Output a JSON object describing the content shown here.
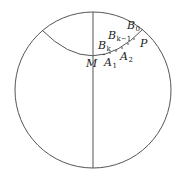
{
  "figure": {
    "colors": {
      "stroke": "#555555",
      "text": "#222222",
      "background": "#ffffff"
    }
  },
  "labels": {
    "B0": {
      "main": "B",
      "sub": "0"
    },
    "Bk1": {
      "main": "B",
      "sub": "k−1"
    },
    "Bk": {
      "main": "B",
      "sub": "k"
    },
    "P": {
      "main": "P",
      "sub": ""
    },
    "M": {
      "main": "M",
      "sub": ""
    },
    "A1": {
      "main": "A",
      "sub": "1"
    },
    "A2": {
      "main": "A",
      "sub": "2"
    }
  }
}
